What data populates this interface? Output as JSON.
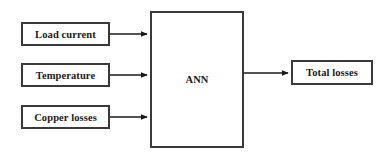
{
  "diagram": {
    "background_color": "#ffffff",
    "border_color": "#3a3a3a",
    "line_color": "#1a1a1a",
    "nodes": [
      {
        "id": "load-current",
        "label": "Load current",
        "role": "input",
        "x": 21,
        "y": 22,
        "w": 89,
        "h": 24
      },
      {
        "id": "temperature",
        "label": "Temperature",
        "role": "input",
        "x": 21,
        "y": 63,
        "w": 89,
        "h": 24
      },
      {
        "id": "copper-losses",
        "label": "Copper losses",
        "role": "input",
        "x": 21,
        "y": 105,
        "w": 89,
        "h": 24
      },
      {
        "id": "ann",
        "label": "ANN",
        "role": "process",
        "x": 150,
        "y": 11,
        "w": 94,
        "h": 137
      },
      {
        "id": "total-losses",
        "label": "Total losses",
        "role": "output",
        "x": 291,
        "y": 60,
        "w": 82,
        "h": 25
      }
    ],
    "edges": [
      {
        "id": "edge-load-current-to-ann",
        "from": "load-current",
        "to": "ann",
        "x1": 110,
        "y1": 34,
        "x2": 150,
        "y2": 34
      },
      {
        "id": "edge-temperature-to-ann",
        "from": "temperature",
        "to": "ann",
        "x1": 110,
        "y1": 75,
        "x2": 150,
        "y2": 75
      },
      {
        "id": "edge-copper-losses-to-ann",
        "from": "copper-losses",
        "to": "ann",
        "x1": 110,
        "y1": 117,
        "x2": 150,
        "y2": 117
      },
      {
        "id": "edge-ann-to-total-losses",
        "from": "ann",
        "to": "total-losses",
        "x1": 244,
        "y1": 73,
        "x2": 291,
        "y2": 73
      }
    ]
  }
}
